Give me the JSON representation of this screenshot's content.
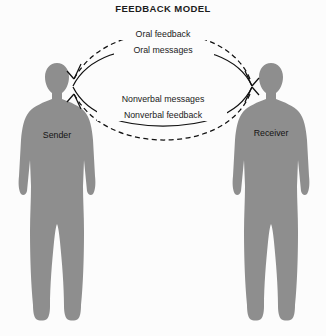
{
  "diagram": {
    "title": "FEEDBACK MODEL",
    "background_color": "#fcfcfc",
    "figure_color": "#8e8e8e",
    "line_color": "#111111"
  },
  "actors": {
    "sender": {
      "label": "Sender",
      "side": "left"
    },
    "receiver": {
      "label": "Receiver",
      "side": "right"
    }
  },
  "flows": [
    {
      "id": "oral-feedback",
      "label": "Oral feedback",
      "style": "dashed",
      "direction": "receiver-to-sender",
      "position": "outer-top"
    },
    {
      "id": "oral-messages",
      "label": "Oral messages",
      "style": "solid",
      "direction": "sender-to-receiver",
      "position": "inner-top"
    },
    {
      "id": "nonverbal-messages",
      "label": "Nonverbal messages",
      "style": "solid",
      "direction": "sender-to-receiver",
      "position": "inner-bottom"
    },
    {
      "id": "nonverbal-feedback",
      "label": "Nonverbal feedback",
      "style": "dashed",
      "direction": "receiver-to-sender",
      "position": "outer-bottom"
    }
  ]
}
